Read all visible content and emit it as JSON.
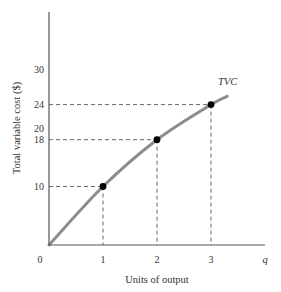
{
  "chart_data": {
    "type": "line",
    "title": "",
    "xlabel": "Units of output",
    "ylabel": "Total variable cost ($)",
    "x_axis_end_label": "q",
    "origin_label": "0",
    "xlim": [
      0,
      3.4
    ],
    "ylim": [
      0,
      36
    ],
    "x_ticks": [
      1,
      2,
      3
    ],
    "y_ticks": [
      10,
      18,
      20,
      24,
      30
    ],
    "grid": false,
    "legend": "none",
    "series": [
      {
        "name": "TVC",
        "label_position": "end of curve",
        "curve": [
          [
            0,
            0
          ],
          [
            1,
            10
          ],
          [
            2,
            18
          ],
          [
            3,
            24
          ],
          [
            3.3,
            25.4
          ]
        ],
        "points": [
          {
            "x": 1,
            "y": 10
          },
          {
            "x": 2,
            "y": 18
          },
          {
            "x": 3,
            "y": 24
          }
        ]
      }
    ],
    "annotations": [
      {
        "type": "dashed-guide",
        "x": 1,
        "y": 10
      },
      {
        "type": "dashed-guide",
        "x": 2,
        "y": 18
      },
      {
        "type": "dashed-guide",
        "x": 3,
        "y": 24
      }
    ]
  },
  "colors": {
    "axis": "#555555",
    "curve": "#8c8c8c",
    "points": "#000000",
    "guides": "#555555",
    "text": "#333333"
  }
}
